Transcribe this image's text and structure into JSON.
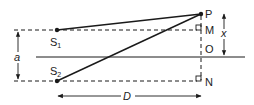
{
  "diagram": {
    "type": "two-source interference geometry",
    "labels": {
      "P": "P",
      "M": "M",
      "O": "O",
      "N": "N",
      "S1": "S",
      "S1_sub": "1",
      "S2": "S",
      "S2_sub": "2",
      "a": "a",
      "x": "x",
      "D": "D"
    },
    "points": {
      "S1": [
        57,
        30
      ],
      "S2": [
        57,
        81
      ],
      "P": [
        201,
        14
      ],
      "M": [
        201,
        30
      ],
      "O": [
        201,
        57
      ],
      "N": [
        201,
        81
      ]
    },
    "colors": {
      "line": "#1a1a1a",
      "background": "#ffffff"
    }
  }
}
